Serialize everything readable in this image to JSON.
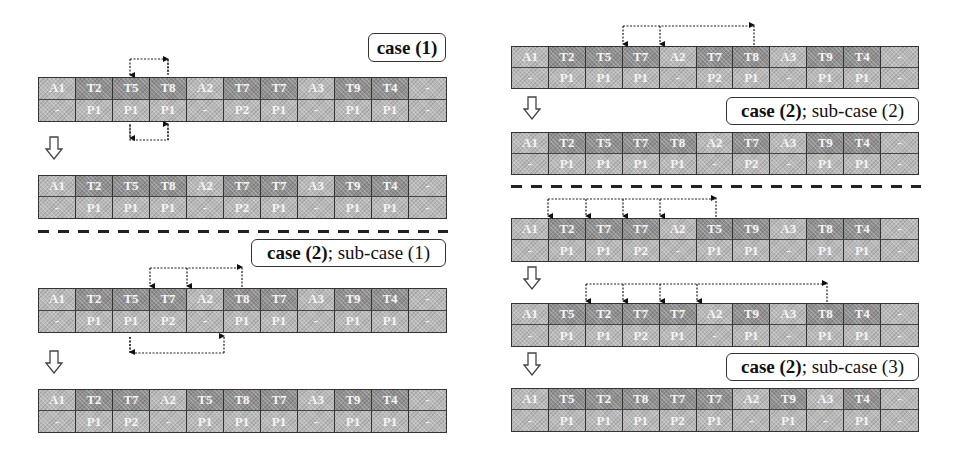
{
  "labels": {
    "case1": {
      "bold": "case (1)",
      "rest": ""
    },
    "case2_sub1": {
      "bold": "case (2)",
      "rest": "; sub-case (1)"
    },
    "case2_sub2": {
      "bold": "case (2)",
      "rest": "; sub-case (2)"
    },
    "case2_sub3": {
      "bold": "case (2)",
      "rest": "; sub-case (3)"
    }
  },
  "tables": {
    "left_1": {
      "top": [
        "A1",
        "T2",
        "T5",
        "T8",
        "A2",
        "T7",
        "T7",
        "A3",
        "T9",
        "T4",
        "-"
      ],
      "bottom": [
        "-",
        "P1",
        "P1",
        "P1",
        "-",
        "P2",
        "P1",
        "-",
        "P1",
        "P1",
        "-"
      ]
    },
    "left_2": {
      "top": [
        "A1",
        "T2",
        "T5",
        "T8",
        "A2",
        "T7",
        "T7",
        "A3",
        "T9",
        "T4",
        "-"
      ],
      "bottom": [
        "-",
        "P1",
        "P1",
        "P1",
        "-",
        "P2",
        "P1",
        "-",
        "P1",
        "P1",
        "-"
      ]
    },
    "left_3": {
      "top": [
        "A1",
        "T2",
        "T5",
        "T7",
        "A2",
        "T8",
        "T7",
        "A3",
        "T9",
        "T4",
        "-"
      ],
      "bottom": [
        "-",
        "P1",
        "P1",
        "P2",
        "-",
        "P1",
        "P1",
        "-",
        "P1",
        "P1",
        "-"
      ]
    },
    "left_4": {
      "top": [
        "A1",
        "T2",
        "T7",
        "A2",
        "T5",
        "T8",
        "T7",
        "A3",
        "T9",
        "T4",
        "-"
      ],
      "bottom": [
        "-",
        "P1",
        "P2",
        "-",
        "P1",
        "P1",
        "P1",
        "-",
        "P1",
        "P1",
        "-"
      ]
    },
    "right_1": {
      "top": [
        "A1",
        "T2",
        "T5",
        "T7",
        "A2",
        "T7",
        "T8",
        "A3",
        "T9",
        "T4",
        "-"
      ],
      "bottom": [
        "-",
        "P1",
        "P1",
        "P1",
        "-",
        "P2",
        "P1",
        "-",
        "P1",
        "P1",
        "-"
      ]
    },
    "right_2": {
      "top": [
        "A1",
        "T2",
        "T5",
        "T7",
        "T8",
        "A2",
        "T7",
        "A3",
        "T9",
        "T4",
        "-"
      ],
      "bottom": [
        "-",
        "P1",
        "P1",
        "P1",
        "P1",
        "-",
        "P2",
        "-",
        "P1",
        "P1",
        "-"
      ]
    },
    "right_3": {
      "top": [
        "A1",
        "T2",
        "T7",
        "T7",
        "A2",
        "T5",
        "T9",
        "A3",
        "T8",
        "T4",
        "-"
      ],
      "bottom": [
        "-",
        "P1",
        "P1",
        "P2",
        "-",
        "P1",
        "P1",
        "-",
        "P1",
        "P1",
        "-"
      ]
    },
    "right_4": {
      "top": [
        "A1",
        "T5",
        "T2",
        "T7",
        "T7",
        "A2",
        "T9",
        "A3",
        "T8",
        "T4",
        "-"
      ],
      "bottom": [
        "-",
        "P1",
        "P1",
        "P2",
        "P1",
        "-",
        "P1",
        "-",
        "P1",
        "P1",
        "-"
      ]
    },
    "right_5": {
      "top": [
        "A1",
        "T5",
        "T2",
        "T8",
        "T7",
        "T7",
        "A2",
        "T9",
        "A3",
        "T4",
        "-"
      ],
      "bottom": [
        "-",
        "P1",
        "P1",
        "P1",
        "P2",
        "P1",
        "-",
        "P1",
        "-",
        "P1",
        "-"
      ]
    }
  },
  "colors": {
    "cell_light": "#b9b9b9",
    "cell_dark": "#8f8f8f",
    "border": "#333333",
    "text": "#f4f4f4"
  }
}
